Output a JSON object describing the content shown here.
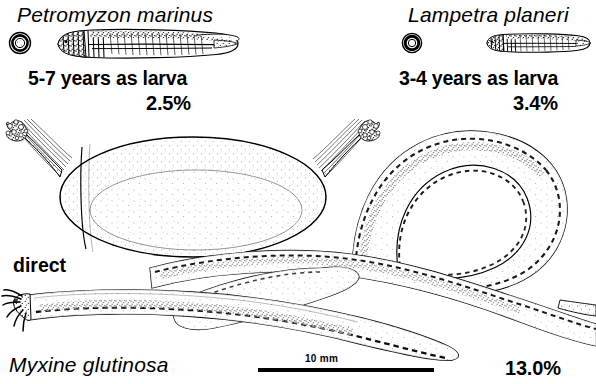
{
  "figure": {
    "background_color": "#ffffff",
    "ink_color": "#000000",
    "caption_note": "Comparative life-history diagram of three cyclostomes"
  },
  "panels": [
    {
      "id": "petromyzon",
      "species_name": "Petromyzon marinus",
      "development_text": "5-7 years as larva",
      "percentage": "2.5%",
      "egg_icon": "small-round-egg-icon",
      "larva_icon": "ammocoete-larva-icon"
    },
    {
      "id": "lampetra",
      "species_name": "Lampetra planeri",
      "development_text": "3-4 years as larva",
      "percentage": "3.4%",
      "egg_icon": "small-round-egg-icon",
      "larva_icon": "ammocoete-larva-icon"
    },
    {
      "id": "myxine",
      "species_name": "Myxine glutinosa",
      "development_text": "direct",
      "percentage": "13.0%",
      "egg_icon": "large-elongate-egg-icon",
      "adult_icon": "hagfish-knotted-body-icon"
    }
  ],
  "scale_bar": {
    "label": "10 mm",
    "x_start": 258,
    "x_end": 434,
    "y": 370
  }
}
